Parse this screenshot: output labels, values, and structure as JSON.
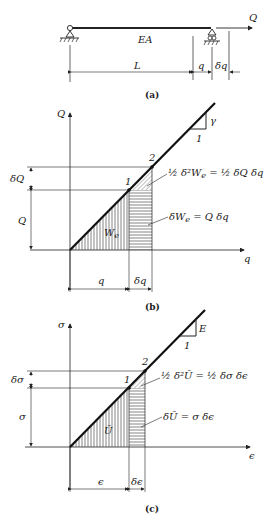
{
  "panels": [
    {
      "id": "a",
      "caption": "(a)",
      "labels": {
        "load": "Q",
        "stiffness": "EA",
        "length": "L",
        "displacement": "q",
        "increment": "δq"
      }
    },
    {
      "id": "b",
      "caption": "(b)",
      "axes": {
        "y": "Q",
        "x": "q"
      },
      "points": [
        "1",
        "2"
      ],
      "slope": {
        "rise": "γ",
        "run": "1"
      },
      "dims": {
        "y_increment": "δQ",
        "y_value": "Q",
        "x_value": "q",
        "x_increment": "δq"
      },
      "area_label": "W",
      "area_sub": "e",
      "annotation_triangle": {
        "frac": "½",
        "text": "δ²W",
        "sub": "e",
        "eq": "= ½ δQ δq"
      },
      "annotation_rect": {
        "text": "δW",
        "sub": "e",
        "eq": "= Q δq"
      }
    },
    {
      "id": "c",
      "caption": "(c)",
      "axes": {
        "y": "σ",
        "x": "ϵ"
      },
      "points": [
        "1",
        "2"
      ],
      "slope": {
        "rise": "E",
        "run": "1"
      },
      "dims": {
        "y_increment": "δσ",
        "y_value": "σ",
        "x_value": "ϵ",
        "x_increment": "δϵ"
      },
      "area_label": "Ū",
      "annotation_triangle": {
        "frac": "½",
        "text": "δ²Ū",
        "eq": "= ½ δσ δϵ"
      },
      "annotation_rect": {
        "text": "δŪ",
        "eq": "= σ δϵ"
      }
    }
  ]
}
